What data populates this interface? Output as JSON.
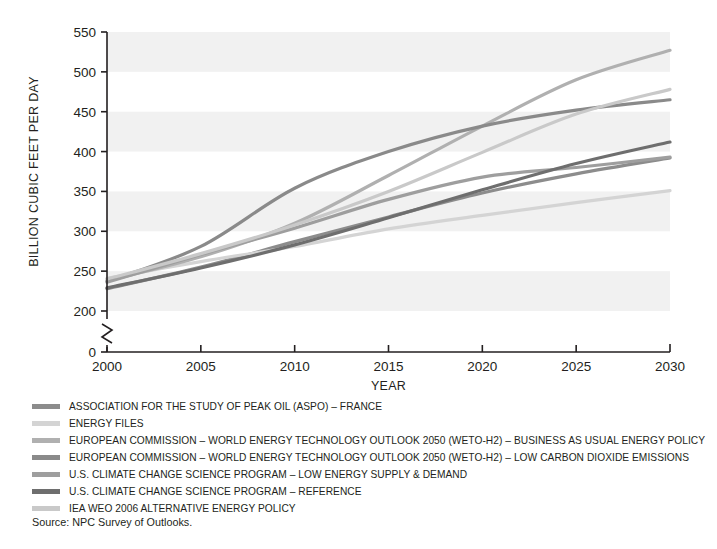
{
  "chart_data": {
    "type": "line",
    "title": "",
    "xlabel": "YEAR",
    "ylabel": "BILLION CUBIC FEET PER DAY",
    "xlim": [
      2000,
      2030
    ],
    "ylim": [
      200,
      550
    ],
    "y_axis_break": true,
    "y_break_low": 0,
    "xticks": [
      "2000",
      "2005",
      "2010",
      "2015",
      "2020",
      "2025",
      "2030"
    ],
    "yticks": [
      "0",
      "200",
      "250",
      "300",
      "350",
      "400",
      "450",
      "500",
      "550"
    ],
    "grid": false,
    "banding": true,
    "legend_position": "below",
    "x": [
      2000,
      2005,
      2010,
      2015,
      2020,
      2025,
      2030
    ],
    "series": [
      {
        "name": "ASSOCIATION FOR THE STUDY OF PEAK OIL (ASPO) – FRANCE",
        "color": "#8c8c8c",
        "values": [
          228,
          255,
          287,
          318,
          348,
          372,
          392
        ]
      },
      {
        "name": "ENERGY FILES",
        "color": "#d4d4d4",
        "values": [
          241,
          262,
          281,
          303,
          320,
          336,
          351
        ]
      },
      {
        "name": "EUROPEAN COMMISSION – WORLD ENERGY TECHNOLOGY OUTLOOK 2050 (WETO-H2) – BUSINESS AS USUAL ENERGY POLICY",
        "color": "#b0b0b0",
        "values": [
          238,
          268,
          310,
          370,
          432,
          490,
          527
        ]
      },
      {
        "name": "EUROPEAN COMMISSION – WORLD ENERGY TECHNOLOGY OUTLOOK 2050 (WETO-H2) – LOW CARBON DIOXIDE EMISSIONS",
        "color": "#8a8a8a",
        "values": [
          237,
          281,
          354,
          400,
          432,
          452,
          465
        ]
      },
      {
        "name": "U.S. CLIMATE CHANGE SCIENCE PROGRAM – LOW ENERGY SUPPLY & DEMAND",
        "color": "#9e9e9e",
        "values": [
          236,
          271,
          304,
          340,
          368,
          380,
          393
        ]
      },
      {
        "name": "U.S. CLIMATE CHANGE SCIENCE PROGRAM – REFERENCE",
        "color": "#6e6e6e",
        "values": [
          229,
          254,
          283,
          317,
          352,
          385,
          412
        ]
      },
      {
        "name": "IEA WEO 2006 ALTERNATIVE ENERGY POLICY",
        "color": "#c9c9c9",
        "values": [
          240,
          272,
          308,
          350,
          399,
          447,
          478
        ]
      }
    ]
  },
  "source": {
    "text": "Source: NPC Survey of Outlooks."
  }
}
